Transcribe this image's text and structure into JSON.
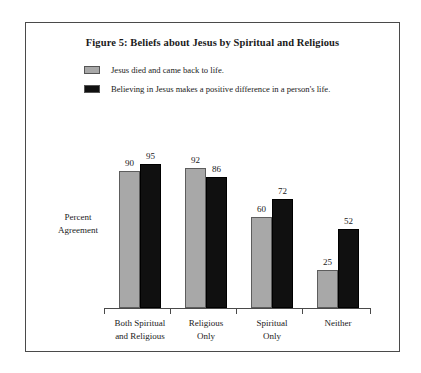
{
  "figure": {
    "title": "Figure 5: Beliefs about Jesus by Spiritual and Religious",
    "y_axis_label_line1": "Percent",
    "y_axis_label_line2": "Agreement"
  },
  "legend": {
    "items": [
      {
        "label": "Jesus died and came back to life.",
        "color": "#a8a8a8",
        "swatch_name": "legend-swatch-light"
      },
      {
        "label": "Believing in Jesus makes a positive difference in a person's life.",
        "color": "#101010",
        "swatch_name": "legend-swatch-dark"
      }
    ]
  },
  "chart_data": {
    "type": "bar",
    "title": "Figure 5: Beliefs about Jesus by Spiritual and Religious",
    "xlabel": "",
    "ylabel": "Percent Agreement",
    "ylim": [
      0,
      100
    ],
    "grid": false,
    "legend_position": "top-left",
    "categories": [
      "Both Spiritual and Religious",
      "Religious Only",
      "Spiritual Only",
      "Neither"
    ],
    "category_lines": [
      [
        "Both Spiritual",
        "and Religious"
      ],
      [
        "Religious",
        "Only"
      ],
      [
        "Spiritual",
        "Only"
      ],
      [
        "Neither"
      ]
    ],
    "series": [
      {
        "name": "Jesus died and came back to life.",
        "color": "#a8a8a8",
        "values": [
          90,
          92,
          60,
          25
        ]
      },
      {
        "name": "Believing in Jesus makes a positive difference in a person's life.",
        "color": "#101010",
        "values": [
          95,
          86,
          72,
          52
        ]
      }
    ]
  }
}
